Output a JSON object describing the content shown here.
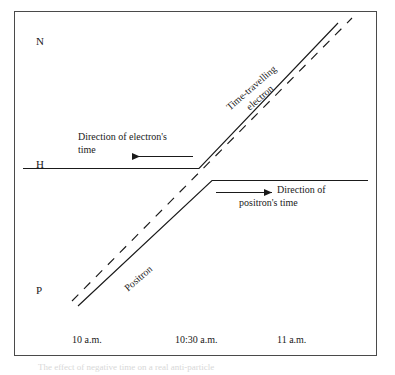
{
  "figure": {
    "border_color": "#4a4a4a",
    "stroke_color": "#1a1a1a",
    "background": "#ffffff"
  },
  "axis_labels": {
    "top": "N",
    "middle": "H",
    "bottom": "P"
  },
  "time_axis": {
    "ticks": [
      {
        "label": "10 a.m."
      },
      {
        "label": "10:30 a.m."
      },
      {
        "label": "11 a.m."
      }
    ]
  },
  "annotations": {
    "electron_direction": {
      "line1": "Direction of electron's",
      "line2": "time",
      "arrow": "left-arrow-icon"
    },
    "positron_direction": {
      "line1": "Direction of",
      "line2": "positron's time",
      "arrow": "right-arrow-icon"
    }
  },
  "curve_labels": {
    "electron": "Time-travelling\nelectron",
    "electron_line1": "Time-travelling",
    "electron_line2": "electron",
    "positron": "Positron"
  },
  "caption": {
    "text": "The effect of negative time on a real anti-particle"
  }
}
